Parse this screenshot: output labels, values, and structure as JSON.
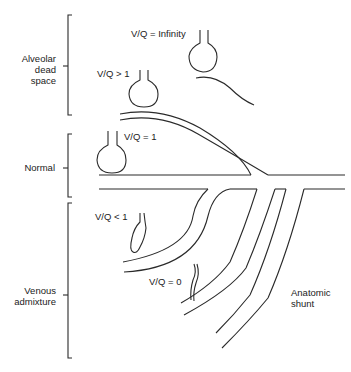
{
  "diagram": {
    "categories": [
      {
        "label_line1": "Alveolar",
        "label_line2": "dead",
        "label_line3": "space"
      },
      {
        "label_line1": "Normal"
      },
      {
        "label_line1": "Venous",
        "label_line2": "admixture"
      }
    ],
    "vq_labels": {
      "infinity": "V/Q = Infinity",
      "greater_than_one": "V/Q > 1",
      "equals_one": "V/Q = 1",
      "less_than_one": "V/Q < 1",
      "zero": "V/Q = 0"
    },
    "anatomic_shunt": {
      "line1": "Anatomic",
      "line2": "shunt"
    },
    "colors": {
      "line": "#2a2a2a",
      "background": "#ffffff"
    }
  }
}
